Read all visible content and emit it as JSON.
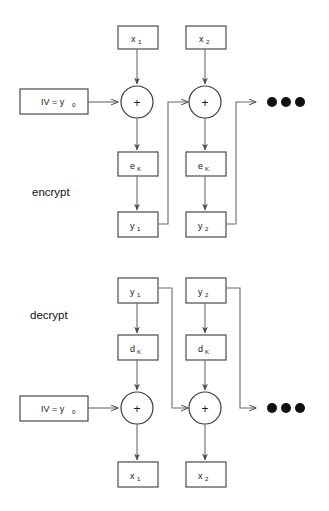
{
  "diagram": {
    "colors": {
      "background": "#ffffff",
      "box_stroke": "#4a4a4a",
      "wire": "#6a6a72",
      "text": "#1a1a1a",
      "dot": "#111111"
    },
    "sections": [
      {
        "id": "encrypt",
        "label": "encrypt",
        "label_x": 32,
        "label_y": 196,
        "iv": {
          "text": "IV = y",
          "sub": "0",
          "x": 20,
          "y": 89,
          "w": 68,
          "h": 25
        },
        "blocks": [
          {
            "id": "enc-block-1",
            "cx": 137,
            "input": {
              "text": "x",
              "sub": "1",
              "x": 118,
              "y": 26,
              "w": 40,
              "h": 23
            },
            "cipher": {
              "text": "e",
              "sub": "K",
              "x": 118,
              "y": 152,
              "w": 40,
              "h": 24
            },
            "output": {
              "text": "y",
              "sub": "1",
              "x": 118,
              "y": 212,
              "w": 40,
              "h": 25
            },
            "xor": {
              "cx": 137,
              "cy": 102,
              "r": 16,
              "glyph": "+"
            }
          },
          {
            "id": "enc-block-2",
            "cx": 205,
            "input": {
              "text": "x",
              "sub": "2",
              "x": 186,
              "y": 26,
              "w": 40,
              "h": 23
            },
            "cipher": {
              "text": "e",
              "sub": "K",
              "x": 186,
              "y": 152,
              "w": 40,
              "h": 24
            },
            "output": {
              "text": "y",
              "sub": "2",
              "x": 186,
              "y": 212,
              "w": 40,
              "h": 25
            },
            "xor": {
              "cx": 205,
              "cy": 102,
              "r": 16,
              "glyph": "+"
            }
          }
        ],
        "ellipsis": {
          "cx": 272,
          "cy": 102,
          "count": 3,
          "r": 5,
          "gap": 14
        }
      },
      {
        "id": "decrypt",
        "label": "decrypt",
        "label_x": 30,
        "label_y": 319,
        "iv": {
          "text": "IV = y",
          "sub": "0",
          "x": 20,
          "y": 396,
          "w": 68,
          "h": 25
        },
        "blocks": [
          {
            "id": "dec-block-1",
            "cx": 137,
            "input": {
              "text": "y",
              "sub": "1",
              "x": 118,
              "y": 278,
              "w": 40,
              "h": 25
            },
            "cipher": {
              "text": "d",
              "sub": "K",
              "x": 118,
              "y": 335,
              "w": 40,
              "h": 25
            },
            "output": {
              "text": "x",
              "sub": "1",
              "x": 118,
              "y": 462,
              "w": 40,
              "h": 25
            },
            "xor": {
              "cx": 137,
              "cy": 408,
              "r": 16,
              "glyph": "+"
            }
          },
          {
            "id": "dec-block-2",
            "cx": 205,
            "input": {
              "text": "y",
              "sub": "2",
              "x": 186,
              "y": 278,
              "w": 40,
              "h": 25
            },
            "cipher": {
              "text": "d",
              "sub": "K",
              "x": 186,
              "y": 335,
              "w": 40,
              "h": 25
            },
            "output": {
              "text": "x",
              "sub": "2",
              "x": 186,
              "y": 462,
              "w": 40,
              "h": 25
            },
            "xor": {
              "cx": 205,
              "cy": 408,
              "r": 16,
              "glyph": "+"
            }
          }
        ],
        "ellipsis": {
          "cx": 272,
          "cy": 408,
          "count": 3,
          "r": 5,
          "gap": 14
        }
      }
    ]
  }
}
